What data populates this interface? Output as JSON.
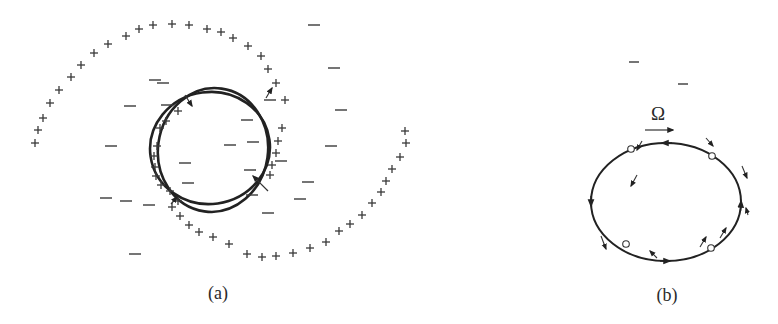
{
  "figure": {
    "panels": [
      {
        "id": "a",
        "label": "(a)",
        "label_pos": [
          218,
          299
        ],
        "description": "Bar/oval rings with spiral arms of positive charge (+) and scattered negative (−) regions",
        "rings": [
          {
            "cx": 210,
            "cy": 148,
            "rx": 60,
            "ry": 56,
            "rot": -8
          },
          {
            "cx": 213,
            "cy": 150,
            "rx": 55,
            "ry": 62,
            "rot": 8
          }
        ],
        "plus_marks": [
          [
            35,
            143
          ],
          [
            38,
            130
          ],
          [
            43,
            118
          ],
          [
            50,
            103
          ],
          [
            59,
            90
          ],
          [
            71,
            77
          ],
          [
            81,
            65
          ],
          [
            94,
            53
          ],
          [
            108,
            44
          ],
          [
            126,
            36
          ],
          [
            139,
            29
          ],
          [
            153,
            25
          ],
          [
            172,
            24
          ],
          [
            189,
            25
          ],
          [
            207,
            29
          ],
          [
            221,
            32
          ],
          [
            233,
            38
          ],
          [
            248,
            46
          ],
          [
            261,
            56
          ],
          [
            268,
            69
          ],
          [
            276,
            83
          ],
          [
            285,
            100
          ],
          [
            178,
            111
          ],
          [
            166,
            121
          ],
          [
            160,
            128
          ],
          [
            157,
            146
          ],
          [
            154,
            156
          ],
          [
            155,
            167
          ],
          [
            156,
            176
          ],
          [
            161,
            185
          ],
          [
            170,
            191
          ],
          [
            178,
            201
          ],
          [
            282,
            128
          ],
          [
            278,
            141
          ],
          [
            276,
            153
          ],
          [
            272,
            165
          ],
          [
            270,
            175
          ],
          [
            172,
            207
          ],
          [
            180,
            216
          ],
          [
            189,
            225
          ],
          [
            199,
            232
          ],
          [
            213,
            237
          ],
          [
            229,
            244
          ],
          [
            247,
            254
          ],
          [
            262,
            257
          ],
          [
            276,
            256
          ],
          [
            293,
            253
          ],
          [
            310,
            248
          ],
          [
            326,
            242
          ],
          [
            339,
            231
          ],
          [
            350,
            224
          ],
          [
            362,
            215
          ],
          [
            372,
            203
          ],
          [
            381,
            192
          ],
          [
            386,
            181
          ],
          [
            392,
            169
          ],
          [
            400,
            157
          ],
          [
            406,
            143
          ],
          [
            405,
            131
          ]
        ],
        "minus_marks": [
          [
            314,
            25
          ],
          [
            334,
            68
          ],
          [
            341,
            110
          ],
          [
            331,
            146
          ],
          [
            111,
            146
          ],
          [
            130,
            106
          ],
          [
            163,
            83
          ],
          [
            155,
            80
          ],
          [
            167,
            105
          ],
          [
            106,
            198
          ],
          [
            126,
            201
          ],
          [
            149,
            205
          ],
          [
            185,
            163
          ],
          [
            188,
            183
          ],
          [
            253,
            142
          ],
          [
            250,
            170
          ],
          [
            252,
            195
          ],
          [
            281,
            161
          ],
          [
            308,
            182
          ],
          [
            300,
            199
          ],
          [
            268,
            213
          ],
          [
            135,
            254
          ],
          [
            230,
            145
          ],
          [
            247,
            120
          ],
          [
            270,
            100
          ]
        ],
        "small_arrows": [
          {
            "x1": 185,
            "y1": 95,
            "x2": 192,
            "y2": 106
          },
          {
            "x1": 266,
            "y1": 98,
            "x2": 272,
            "y2": 88
          },
          {
            "x1": 268,
            "y1": 191,
            "x2": 253,
            "y2": 176
          },
          {
            "x1": 171,
            "y1": 204,
            "x2": 177,
            "y2": 197
          }
        ]
      },
      {
        "id": "b",
        "label": "(b)",
        "label_pos": [
          667,
          301
        ],
        "description": "Elliptical orbit rotating with pattern speed Omega, with velocity arrows and four open-circle points",
        "omega_label": "Ω",
        "omega_pos": [
          658,
          120
        ],
        "omega_arrow": {
          "x1": 645,
          "y1": 130,
          "x2": 673,
          "y2": 130
        },
        "orbit": {
          "cx": 666,
          "cy": 202,
          "rx": 75,
          "ry": 59
        },
        "open_points": [
          [
            631,
            149
          ],
          [
            712,
            156
          ],
          [
            626,
            244
          ],
          [
            711,
            248
          ]
        ],
        "minus_marks": [
          [
            634,
            62
          ],
          [
            683,
            84
          ]
        ]
      }
    ]
  }
}
